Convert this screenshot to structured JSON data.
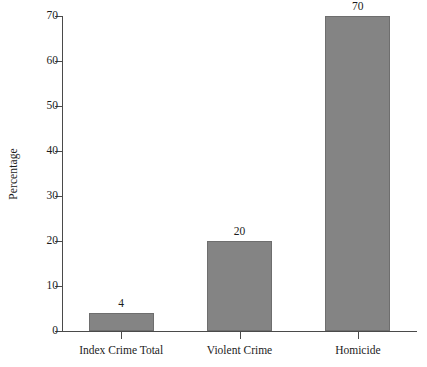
{
  "chart_data": {
    "type": "bar",
    "title": "",
    "subtitle": "",
    "xlabel": "",
    "ylabel": "Percentage",
    "categories": [
      "Index Crime Total",
      "Violent Crime",
      "Homicide"
    ],
    "values": [
      4,
      20,
      70
    ],
    "value_labels": [
      "4",
      "20",
      "70"
    ],
    "ylim": [
      0,
      70
    ],
    "y_ticks": [
      0,
      10,
      20,
      30,
      40,
      50,
      60,
      70
    ],
    "y_tick_labels": [
      "0",
      "10",
      "20",
      "30",
      "40",
      "50",
      "60",
      "70"
    ],
    "grid": false,
    "legend": false,
    "legend_position": "none",
    "bar_color": "#848484",
    "bar_border_color": "#6e6e6e",
    "axis_color": "#4a4a4a",
    "text_color": "#1c1c1c",
    "background_color": "#ffffff"
  }
}
